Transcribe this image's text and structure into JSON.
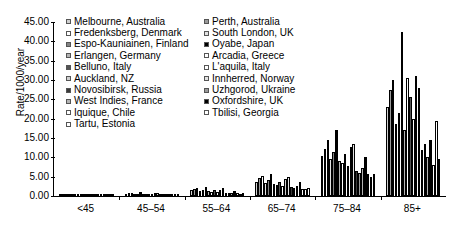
{
  "chart_data": {
    "type": "bar",
    "title": "",
    "xlabel": "",
    "ylabel": "Rate/1000/year",
    "ylim": [
      0,
      45
    ],
    "ytick_values": [
      0,
      5,
      10,
      15,
      20,
      25,
      30,
      35,
      40,
      45
    ],
    "ytick_labels": [
      "0.00",
      "5.00",
      "10.00",
      "15.00",
      "20.00",
      "25.00",
      "30.00",
      "35.00",
      "40.00",
      "45.00"
    ],
    "grid": false,
    "legend_position": "top-center",
    "categories": [
      "<45",
      "45–54",
      "55–64",
      "65–74",
      "75–84",
      "85+"
    ],
    "series": [
      {
        "name": "Melbourne, Australia",
        "fill": "f-l2",
        "values": [
          0.1,
          0.65,
          1.55,
          3.7,
          10.3,
          23.0
        ]
      },
      {
        "name": "Perth, Australia",
        "fill": "f-m2",
        "values": [
          0.12,
          0.7,
          1.7,
          4.6,
          12.2,
          27.5
        ]
      },
      {
        "name": "Fredenksberg, Denmark",
        "fill": "f-white",
        "values": [
          0.14,
          0.8,
          2.2,
          5.3,
          14.6,
          30.0
        ]
      },
      {
        "name": "South London, UK",
        "fill": "f-l1",
        "values": [
          0.08,
          0.5,
          1.3,
          3.4,
          9.5,
          18.5
        ]
      },
      {
        "name": "Espo-Kauniainen, Finland",
        "fill": "f-m3",
        "values": [
          0.11,
          0.62,
          1.6,
          4.1,
          11.4,
          21.5
        ]
      },
      {
        "name": "Oyabe, Japan",
        "fill": "f-black",
        "values": [
          0.09,
          0.95,
          2.3,
          5.8,
          17.0,
          42.5
        ]
      },
      {
        "name": "Erlangen, Germany",
        "fill": "f-m1",
        "values": [
          0.07,
          0.45,
          1.25,
          3.1,
          9.0,
          17.0
        ]
      },
      {
        "name": "Arcadia, Greece",
        "fill": "f-white",
        "values": [
          0.06,
          0.4,
          1.1,
          2.9,
          8.6,
          30.5
        ]
      },
      {
        "name": "Belluno, Italy",
        "fill": "f-d2",
        "values": [
          0.1,
          0.58,
          1.45,
          3.6,
          10.8,
          25.5
        ]
      },
      {
        "name": "L'aquila, Italy",
        "fill": "f-white",
        "values": [
          0.05,
          0.35,
          0.95,
          2.6,
          7.8,
          20.0
        ]
      },
      {
        "name": "Auckland, NZ",
        "fill": "f-l2",
        "values": [
          0.12,
          0.68,
          1.65,
          4.3,
          12.8,
          31.0
        ]
      },
      {
        "name": "Innherred, Norway",
        "fill": "f-l1",
        "values": [
          0.13,
          0.75,
          1.95,
          4.9,
          13.5,
          28.0
        ]
      },
      {
        "name": "Novosibirsk, Russia",
        "fill": "f-d3",
        "values": [
          0.04,
          0.3,
          0.85,
          2.3,
          6.5,
          12.0
        ]
      },
      {
        "name": "Uzhgorod, Ukraine",
        "fill": "f-m2",
        "values": [
          0.04,
          0.28,
          0.8,
          2.1,
          6.0,
          13.5
        ]
      },
      {
        "name": "West Indies, France",
        "fill": "f-m1",
        "values": [
          0.05,
          0.33,
          0.9,
          2.5,
          7.2,
          10.0
        ]
      },
      {
        "name": "Oxfordshire, UK",
        "fill": "f-black",
        "values": [
          0.09,
          0.55,
          1.4,
          3.5,
          10.0,
          14.5
        ]
      },
      {
        "name": "Iquique, Chile",
        "fill": "f-white",
        "values": [
          0.03,
          0.25,
          0.7,
          1.9,
          5.6,
          8.0
        ]
      },
      {
        "name": "Tbilisi, Georgia",
        "fill": "f-white",
        "values": [
          0.03,
          0.22,
          0.6,
          1.7,
          5.0,
          19.5
        ]
      },
      {
        "name": "Tartu, Estonia",
        "fill": "f-white",
        "values": [
          0.04,
          0.27,
          0.78,
          2.0,
          5.8,
          9.5
        ]
      }
    ]
  },
  "legend": {
    "left_column": [
      "Melbourne, Australia",
      "Fredenksberg, Denmark",
      "Espo-Kauniainen, Finland",
      "Erlangen, Germany",
      "Belluno, Italy",
      "Auckland, NZ",
      "Novosibirsk, Russia",
      "West Indies, France",
      "Iquique, Chile",
      "Tartu, Estonia"
    ],
    "right_column": [
      "Perth, Australia",
      "South London, UK",
      "Oyabe, Japan",
      "Arcadia, Greece",
      "L'aquila, Italy",
      "Innherred, Norway",
      "Uzhgorod, Ukraine",
      "Oxfordshire, UK",
      "Tbilisi, Georgia"
    ],
    "left_fills": [
      "f-l2",
      "f-white",
      "f-m3",
      "f-m1",
      "f-d2",
      "f-l2",
      "f-d3",
      "f-m1",
      "f-white",
      "f-white"
    ],
    "right_fills": [
      "f-m2",
      "f-l1",
      "f-black",
      "f-white",
      "f-white",
      "f-l1",
      "f-m2",
      "f-black",
      "f-white"
    ]
  },
  "colors": {
    "axis": "#000000",
    "background": "#ffffff",
    "bar_outline": "#000000"
  }
}
